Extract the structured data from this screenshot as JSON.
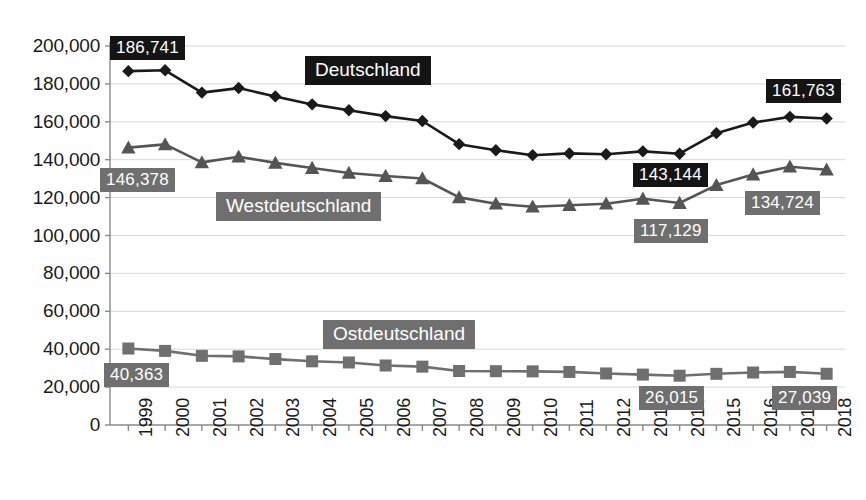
{
  "chart_data": {
    "type": "line",
    "title": "",
    "xlabel": "",
    "ylabel": "",
    "ylim": [
      0,
      200000
    ],
    "ytick_labels": [
      "200,000",
      "180,000",
      "160,000",
      "140,000",
      "120,000",
      "100,000",
      "80,000",
      "60,000",
      "40,000",
      "20,000",
      "0"
    ],
    "ytick_values": [
      200000,
      180000,
      160000,
      140000,
      120000,
      100000,
      80000,
      60000,
      40000,
      20000,
      0
    ],
    "grid": "horizontal",
    "legend": "inline-labels",
    "categories": [
      "1999",
      "2000",
      "2001",
      "2002",
      "2003",
      "2004",
      "2005",
      "2006",
      "2007",
      "2008",
      "2009",
      "2010",
      "2011",
      "2012",
      "2013",
      "2014",
      "2015",
      "2016",
      "2017",
      "2018"
    ],
    "series": [
      {
        "name": "Deutschland",
        "marker": "diamond",
        "color": "#1a1a1a",
        "values": [
          186741,
          187200,
          175400,
          177800,
          173400,
          169200,
          166100,
          163000,
          160400,
          148200,
          145000,
          142400,
          143300,
          142900,
          144400,
          143144,
          154000,
          159600,
          162600,
          161763
        ]
      },
      {
        "name": "Westdeutschland",
        "marker": "triangle",
        "color": "#555555",
        "values": [
          146378,
          148100,
          138600,
          141600,
          138300,
          135600,
          133000,
          131400,
          130100,
          120100,
          116800,
          115200,
          116000,
          116800,
          119400,
          117129,
          126600,
          132200,
          136300,
          134724
        ]
      },
      {
        "name": "Ostdeutschland",
        "marker": "square",
        "color": "#6f6f6f",
        "values": [
          40363,
          39100,
          36500,
          36200,
          34800,
          33600,
          33000,
          31400,
          30800,
          28500,
          28400,
          28300,
          28000,
          27200,
          26600,
          26015,
          27000,
          27700,
          28000,
          27039
        ]
      }
    ],
    "point_labels": [
      {
        "series": "Deutschland",
        "category": "1999",
        "text": "186,741",
        "style": "dark"
      },
      {
        "series": "Deutschland",
        "category": "2014",
        "text": "143,144",
        "style": "dark"
      },
      {
        "series": "Deutschland",
        "category": "2018",
        "text": "161,763",
        "style": "dark"
      },
      {
        "series": "Westdeutschland",
        "category": "1999",
        "text": "146,378",
        "style": "gray"
      },
      {
        "series": "Westdeutschland",
        "category": "2014",
        "text": "117,129",
        "style": "gray"
      },
      {
        "series": "Westdeutschland",
        "category": "2018",
        "text": "134,724",
        "style": "gray"
      },
      {
        "series": "Ostdeutschland",
        "category": "1999",
        "text": "40,363",
        "style": "gray"
      },
      {
        "series": "Ostdeutschland",
        "category": "2014",
        "text": "26,015",
        "style": "gray"
      },
      {
        "series": "Ostdeutschland",
        "category": "2018",
        "text": "27,039",
        "style": "gray"
      }
    ],
    "series_labels": [
      {
        "text": "Deutschland",
        "style": "dark"
      },
      {
        "text": "Westdeutschland",
        "style": "gray"
      },
      {
        "text": "Ostdeutschland",
        "style": "gray"
      }
    ],
    "colors": {
      "deutschland": "#1a1a1a",
      "westdeutschland": "#555555",
      "ostdeutschland": "#6f6f6f",
      "grid": "#d8d8d8",
      "axis": "#8a8a8a",
      "background": "#ffffff",
      "label_dark_bg": "#141414",
      "label_gray_bg": "#6f6f6f",
      "label_text": "#ffffff"
    }
  }
}
